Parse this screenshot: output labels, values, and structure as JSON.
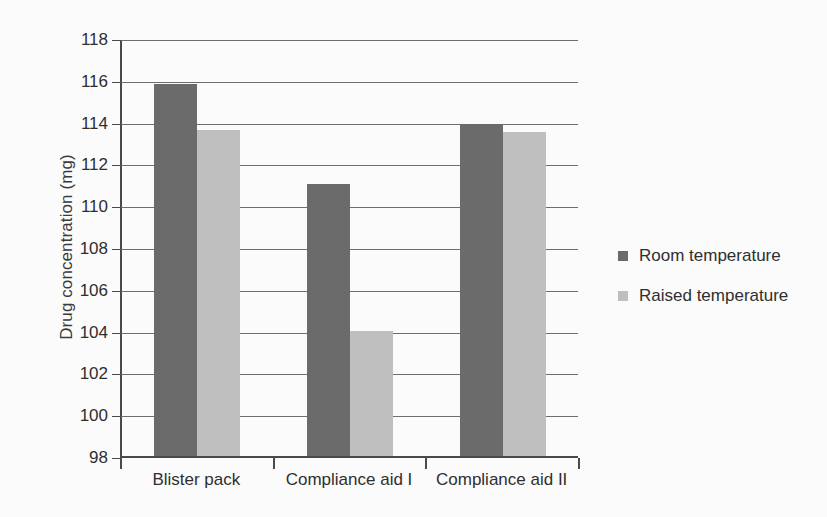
{
  "chart_data": {
    "type": "bar",
    "title": "",
    "xlabel": "",
    "ylabel": "Drug concentration (mg)",
    "categories": [
      "Blister pack",
      "Compliance aid I",
      "Compliance aid II"
    ],
    "series": [
      {
        "name": "Room temperature",
        "color": "#6b6b6b",
        "values": [
          115.9,
          111.1,
          114.0
        ]
      },
      {
        "name": "Raised temperature",
        "color": "#bfbfbf",
        "values": [
          113.7,
          104.1,
          113.6
        ]
      }
    ],
    "ylim": [
      98,
      118
    ],
    "yticks": [
      98,
      100,
      102,
      104,
      106,
      108,
      110,
      112,
      114,
      116,
      118
    ],
    "ytick_labels": [
      "98",
      "100",
      "102",
      "104",
      "106",
      "108",
      "110",
      "112",
      "114",
      "116",
      "118"
    ],
    "grid": true,
    "grid_axis": "y",
    "legend_position": "right",
    "legend": [
      "Room temperature",
      "Raised temperature"
    ]
  }
}
